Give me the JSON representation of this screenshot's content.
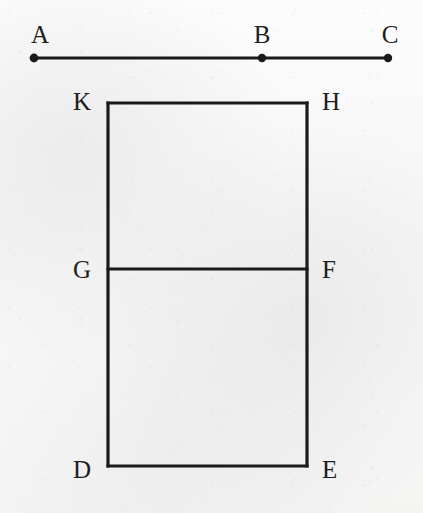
{
  "figure": {
    "background_color": "#f7f7f6",
    "stroke_color": "#1a1a1a",
    "label_color": "#1d1d1d",
    "stroke_width": 3.2,
    "segment": {
      "name": "segment-abc",
      "y": 58,
      "endpoint_radius": 4.2,
      "points": [
        {
          "label": "A",
          "x": 34,
          "y": 58,
          "label_x": 40,
          "label_y": 43,
          "marker": "dot"
        },
        {
          "label": "B",
          "x": 262,
          "y": 58,
          "label_x": 262,
          "label_y": 43,
          "marker": "dot"
        },
        {
          "label": "C",
          "x": 388,
          "y": 58,
          "label_x": 390,
          "label_y": 43,
          "marker": "dot"
        }
      ]
    },
    "rectangle": {
      "name": "rectangle-khed",
      "left": 108,
      "right": 307,
      "top": 103,
      "bottom": 466,
      "corners": [
        {
          "label": "K",
          "x": 108,
          "y": 103,
          "label_x": 91,
          "label_y": 110,
          "anchor": "end"
        },
        {
          "label": "H",
          "x": 307,
          "y": 103,
          "label_x": 322,
          "label_y": 110,
          "anchor": "start"
        },
        {
          "label": "E",
          "x": 307,
          "y": 466,
          "label_x": 322,
          "label_y": 478,
          "anchor": "start"
        },
        {
          "label": "D",
          "x": 108,
          "y": 466,
          "label_x": 91,
          "label_y": 478,
          "anchor": "end"
        }
      ]
    },
    "divider": {
      "name": "divider-gf",
      "y": 269,
      "x_start": 108,
      "x_end": 307,
      "endpoints": [
        {
          "label": "G",
          "x": 108,
          "y": 269,
          "label_x": 91,
          "label_y": 278,
          "anchor": "end"
        },
        {
          "label": "F",
          "x": 307,
          "y": 269,
          "label_x": 322,
          "label_y": 278,
          "anchor": "start"
        }
      ]
    }
  }
}
